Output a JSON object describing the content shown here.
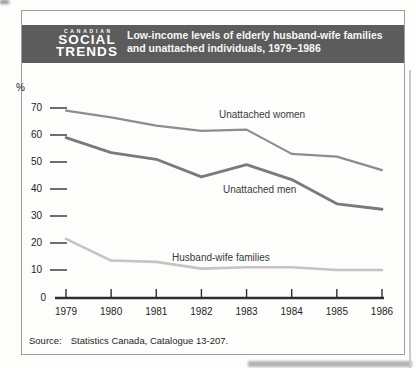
{
  "masthead": {
    "kicker": "CANADIAN",
    "line1": "SOCIAL",
    "line2": "TRENDS"
  },
  "header": {
    "title_line1": "Low-income levels of elderly husband-wife families",
    "title_line2": "and unattached individuals, 1979–1986"
  },
  "footer": {
    "source_label": "Source:",
    "source_text": "Statistics Canada, Catalogue 13-207."
  },
  "colors": {
    "band": "#5c5c5c",
    "band_text": "#ffffff",
    "axis": "#2e2e2e",
    "tick": "#4a4a4a",
    "frame": "#9f9f9f"
  },
  "chart_data": {
    "type": "line",
    "title": "Low-income levels of elderly husband-wife families and unattached individuals, 1979–1986",
    "xlabel": "",
    "ylabel": "%",
    "ylim": [
      0,
      70
    ],
    "y_ticks": [
      70,
      60,
      50,
      40,
      30,
      20,
      10
    ],
    "baseline_label": "0",
    "grid": false,
    "legend": "inline-labels",
    "categories": [
      "1979",
      "1980",
      "1981",
      "1982",
      "1983",
      "1984",
      "1985",
      "1986"
    ],
    "series": [
      {
        "name": "Unattached women",
        "values": [
          69,
          66.5,
          63.5,
          61.5,
          62,
          53,
          52,
          47
        ],
        "color": "#8d8d8d",
        "stroke_width": 2.2,
        "label_x": 219,
        "label_y": 109
      },
      {
        "name": "Unattached men",
        "values": [
          59,
          53.5,
          51,
          44.5,
          49,
          43.5,
          34.5,
          32.5
        ],
        "color": "#7a7a7a",
        "stroke_width": 2.8,
        "label_x": 223,
        "label_y": 184
      },
      {
        "name": "Husband-wife families",
        "values": [
          21.5,
          13.5,
          13,
          10.5,
          11,
          11,
          10,
          10
        ],
        "color": "#c4c4c4",
        "stroke_width": 2.6,
        "label_x": 172,
        "label_y": 252
      }
    ]
  }
}
